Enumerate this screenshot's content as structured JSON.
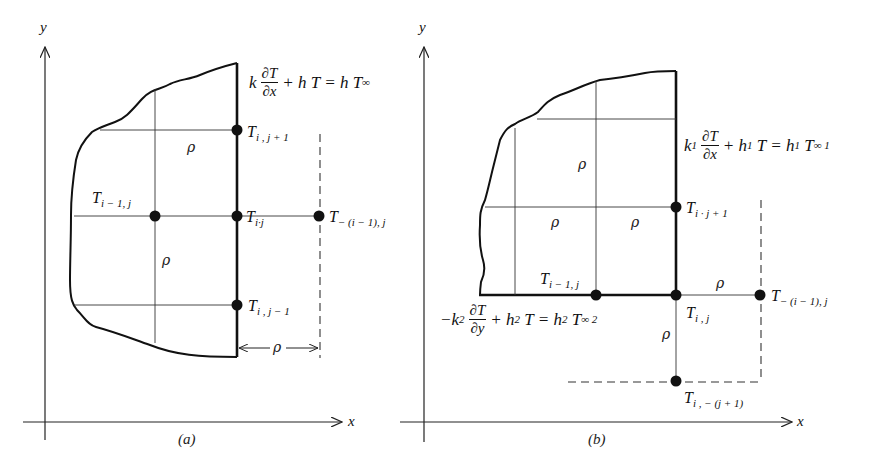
{
  "figure": {
    "panels": [
      {
        "id": "a",
        "caption": "(a)",
        "axes": {
          "x_label": "x",
          "y_label": "y"
        },
        "boundary_condition": {
          "k": "k",
          "numerator": "∂T",
          "denominator": "∂x",
          "rest": "+ h T = h T",
          "infinity_sub": "∞"
        },
        "nodes": [
          {
            "base": "T",
            "sub": "i , j + 1"
          },
          {
            "base": "T",
            "sub": "i − 1, j"
          },
          {
            "base": "T",
            "sub": "i·j"
          },
          {
            "base": "T",
            "sub": "− (i − 1), j"
          },
          {
            "base": "T",
            "sub": "i , j − 1"
          }
        ],
        "spacing_labels": [
          "ρ",
          "ρ",
          "ρ"
        ]
      },
      {
        "id": "b",
        "caption": "(b)",
        "axes": {
          "x_label": "x",
          "y_label": "y"
        },
        "boundary_condition_right": {
          "k": "k",
          "k_sub": "1",
          "numerator": "∂T",
          "denominator": "∂x",
          "h1": "+ h",
          "h1_sub": "1",
          "mid": "T = h",
          "h1b_sub": "1",
          "tail": "T",
          "tinf_sub": "∞ 1"
        },
        "boundary_condition_bottom": {
          "k": "−k",
          "k_sub": "2",
          "numerator": "∂T",
          "denominator": "∂y",
          "h2": "+ h",
          "h2_sub": "2",
          "mid": "T = h",
          "h2b_sub": "2",
          "tail": "T",
          "tinf_sub": "∞ 2"
        },
        "nodes": [
          {
            "base": "T",
            "sub": "i · j + 1"
          },
          {
            "base": "T",
            "sub": "i − 1, j"
          },
          {
            "base": "T",
            "sub": "i , j"
          },
          {
            "base": "T",
            "sub": "− (i − 1), j"
          },
          {
            "base": "T",
            "sub": "i , − (j + 1)"
          }
        ],
        "spacing_labels": [
          "ρ",
          "ρ",
          "ρ",
          "ρ",
          "ρ"
        ]
      }
    ]
  }
}
